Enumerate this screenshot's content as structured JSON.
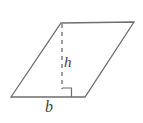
{
  "figure": {
    "kind": "parallelogram-area-diagram",
    "background_color": "#ffffff",
    "stroke_color": "#6e6e6e",
    "label_color": "#3d3d3d",
    "labels": {
      "height": "h",
      "base": "b"
    },
    "shape": {
      "name": "parallelogram",
      "vertices": [
        {
          "name": "bottom-left",
          "x": 11,
          "y": 97
        },
        {
          "name": "top-left",
          "x": 61,
          "y": 23
        },
        {
          "name": "top-right",
          "x": 134,
          "y": 22
        },
        {
          "name": "bottom-right",
          "x": 85,
          "y": 97
        }
      ]
    },
    "height_segment": {
      "name": "altitude",
      "style": "dashed",
      "dash_pattern": "4 4",
      "from": {
        "x": 62,
        "y": 24
      },
      "to": {
        "x": 62,
        "y": 89
      }
    },
    "right_angle_marker": {
      "name": "right-angle-square",
      "x": 62,
      "y": 88,
      "size": 9,
      "orientation": "bottom-right-of-foot"
    }
  }
}
